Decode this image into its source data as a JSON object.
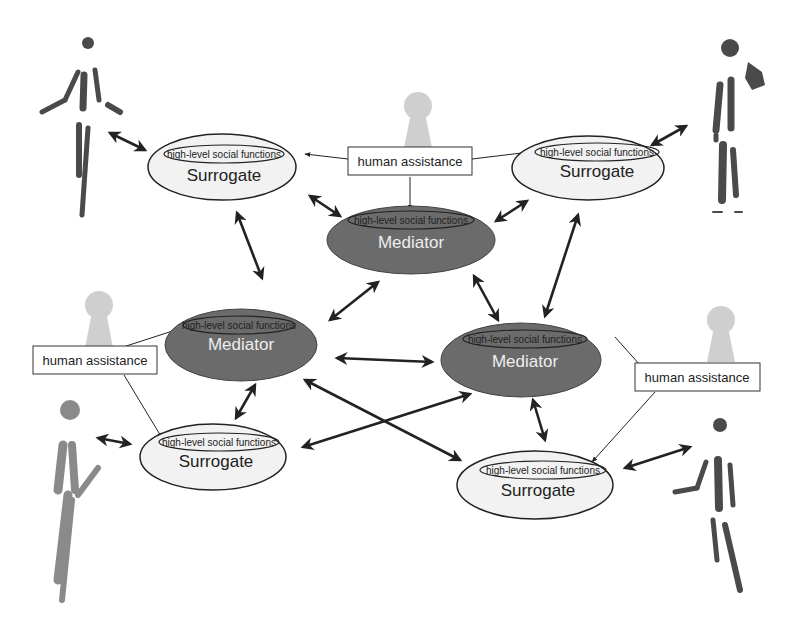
{
  "diagram": {
    "inner_label": "high-level social functions",
    "colors": {
      "surrogate_fill": "#f2f2f2",
      "mediator_fill": "#6b6b6b",
      "mediator_text": "#eeeeee",
      "stroke": "#222222",
      "pawn": "#cfcfcf",
      "figure": "#4a4a4a"
    },
    "surrogates": [
      {
        "id": "surrogate-top-left",
        "label": "Surrogate",
        "inner": "high-level social functions"
      },
      {
        "id": "surrogate-top-right",
        "label": "Surrogate",
        "inner": "high-level social functions"
      },
      {
        "id": "surrogate-bottom-left",
        "label": "Surrogate",
        "inner": "high-level social functions"
      },
      {
        "id": "surrogate-bottom-right",
        "label": "Surrogate",
        "inner": "high-level social functions"
      }
    ],
    "mediators": [
      {
        "id": "mediator-top",
        "label": "Mediator",
        "inner": "high-level social functions"
      },
      {
        "id": "mediator-left",
        "label": "Mediator",
        "inner": "high-level social functions"
      },
      {
        "id": "mediator-right",
        "label": "Mediator",
        "inner": "high-level social functions"
      }
    ],
    "human_assistance": [
      {
        "id": "human-assistance-top",
        "label": "human assistance"
      },
      {
        "id": "human-assistance-left",
        "label": "human assistance"
      },
      {
        "id": "human-assistance-right",
        "label": "human assistance"
      }
    ],
    "figures": [
      "human-figure-top-left",
      "human-figure-top-right",
      "human-figure-bottom-left",
      "human-figure-bottom-right"
    ]
  }
}
